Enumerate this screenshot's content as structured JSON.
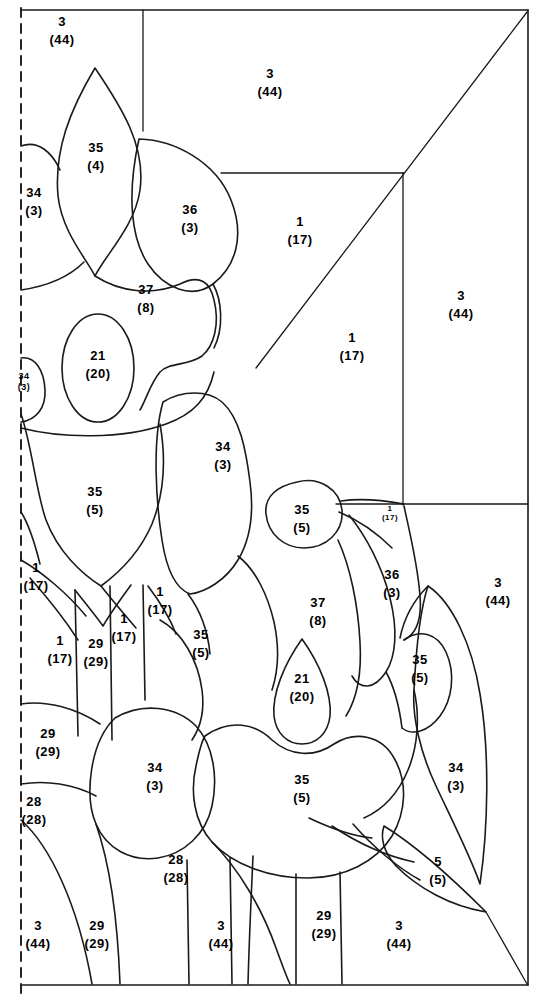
{
  "figure": {
    "type": "patent-line-drawing",
    "title": "",
    "background_color": "#ffffff",
    "line_color": "#1a1a1a",
    "border": {
      "left_dashed": true,
      "top_solid": true,
      "right_solid": true,
      "bottom_solid": true
    }
  },
  "labels": [
    {
      "id": "lbl-1",
      "number": "3",
      "paren": "(44)",
      "x": 62,
      "y": 31,
      "size": "normal"
    },
    {
      "id": "lbl-2",
      "number": "3",
      "paren": "(44)",
      "x": 270,
      "y": 83,
      "size": "normal"
    },
    {
      "id": "lbl-3",
      "number": "35",
      "paren": "(4)",
      "x": 96,
      "y": 157,
      "size": "normal"
    },
    {
      "id": "lbl-4",
      "number": "34",
      "paren": "(3)",
      "x": 34,
      "y": 202,
      "size": "normal"
    },
    {
      "id": "lbl-5",
      "number": "36",
      "paren": "(3)",
      "x": 190,
      "y": 219,
      "size": "normal"
    },
    {
      "id": "lbl-6",
      "number": "1",
      "paren": "(17)",
      "x": 300,
      "y": 231,
      "size": "normal"
    },
    {
      "id": "lbl-7",
      "number": "3",
      "paren": "(44)",
      "x": 461,
      "y": 305,
      "size": "normal"
    },
    {
      "id": "lbl-8",
      "number": "37",
      "paren": "(8)",
      "x": 146,
      "y": 299,
      "size": "normal"
    },
    {
      "id": "lbl-9",
      "number": "1",
      "paren": "(17)",
      "x": 352,
      "y": 347,
      "size": "normal"
    },
    {
      "id": "lbl-10",
      "number": "21",
      "paren": "(20)",
      "x": 98,
      "y": 365,
      "size": "normal"
    },
    {
      "id": "lbl-11",
      "number": "34",
      "paren": "(3)",
      "x": 24,
      "y": 382,
      "size": "small"
    },
    {
      "id": "lbl-12",
      "number": "34",
      "paren": "(3)",
      "x": 223,
      "y": 456,
      "size": "normal"
    },
    {
      "id": "lbl-13",
      "number": "35",
      "paren": "(5)",
      "x": 95,
      "y": 501,
      "size": "normal"
    },
    {
      "id": "lbl-14",
      "number": "35",
      "paren": "(5)",
      "x": 302,
      "y": 519,
      "size": "normal"
    },
    {
      "id": "lbl-15",
      "number": "1",
      "paren": "(17)",
      "x": 390,
      "y": 513,
      "size": "tiny"
    },
    {
      "id": "lbl-16",
      "number": "36",
      "paren": "(3)",
      "x": 392,
      "y": 584,
      "size": "normal"
    },
    {
      "id": "lbl-17",
      "number": "3",
      "paren": "(44)",
      "x": 498,
      "y": 592,
      "size": "normal"
    },
    {
      "id": "lbl-18",
      "number": "1",
      "paren": "(17)",
      "x": 36,
      "y": 577,
      "size": "normal"
    },
    {
      "id": "lbl-19",
      "number": "1",
      "paren": "(17)",
      "x": 160,
      "y": 601,
      "size": "normal"
    },
    {
      "id": "lbl-20",
      "number": "37",
      "paren": "(8)",
      "x": 318,
      "y": 612,
      "size": "normal"
    },
    {
      "id": "lbl-21",
      "number": "1",
      "paren": "(17)",
      "x": 124,
      "y": 628,
      "size": "normal"
    },
    {
      "id": "lbl-22",
      "number": "1",
      "paren": "(17)",
      "x": 60,
      "y": 650,
      "size": "normal"
    },
    {
      "id": "lbl-23",
      "number": "29",
      "paren": "(29)",
      "x": 96,
      "y": 653,
      "size": "normal"
    },
    {
      "id": "lbl-24",
      "number": "35",
      "paren": "(5)",
      "x": 201,
      "y": 644,
      "size": "normal"
    },
    {
      "id": "lbl-25",
      "number": "35",
      "paren": "(5)",
      "x": 420,
      "y": 669,
      "size": "normal"
    },
    {
      "id": "lbl-26",
      "number": "21",
      "paren": "(20)",
      "x": 302,
      "y": 688,
      "size": "normal"
    },
    {
      "id": "lbl-27",
      "number": "29",
      "paren": "(29)",
      "x": 48,
      "y": 743,
      "size": "normal"
    },
    {
      "id": "lbl-28",
      "number": "34",
      "paren": "(3)",
      "x": 155,
      "y": 777,
      "size": "normal"
    },
    {
      "id": "lbl-29",
      "number": "35",
      "paren": "(5)",
      "x": 302,
      "y": 789,
      "size": "normal"
    },
    {
      "id": "lbl-30",
      "number": "34",
      "paren": "(3)",
      "x": 456,
      "y": 777,
      "size": "normal"
    },
    {
      "id": "lbl-31",
      "number": "28",
      "paren": "(28)",
      "x": 34,
      "y": 811,
      "size": "normal"
    },
    {
      "id": "lbl-32",
      "number": "28",
      "paren": "(28)",
      "x": 176,
      "y": 869,
      "size": "normal"
    },
    {
      "id": "lbl-33",
      "number": "5",
      "paren": "(5)",
      "x": 438,
      "y": 871,
      "size": "normal"
    },
    {
      "id": "lbl-34",
      "number": "3",
      "paren": "(44)",
      "x": 38,
      "y": 935,
      "size": "normal"
    },
    {
      "id": "lbl-35",
      "number": "29",
      "paren": "(29)",
      "x": 97,
      "y": 935,
      "size": "normal"
    },
    {
      "id": "lbl-36",
      "number": "3",
      "paren": "(44)",
      "x": 221,
      "y": 935,
      "size": "normal"
    },
    {
      "id": "lbl-37",
      "number": "29",
      "paren": "(29)",
      "x": 324,
      "y": 925,
      "size": "normal"
    },
    {
      "id": "lbl-38",
      "number": "3",
      "paren": "(44)",
      "x": 399,
      "y": 935,
      "size": "normal"
    }
  ],
  "reference_numbers": {
    "unique_parts": [
      "1",
      "3",
      "5",
      "21",
      "28",
      "29",
      "34",
      "35",
      "36",
      "37"
    ],
    "unique_counts": [
      "(4)",
      "(5)",
      "(8)",
      "(17)",
      "(20)",
      "(28)",
      "(29)",
      "(3)",
      "(44)"
    ]
  }
}
